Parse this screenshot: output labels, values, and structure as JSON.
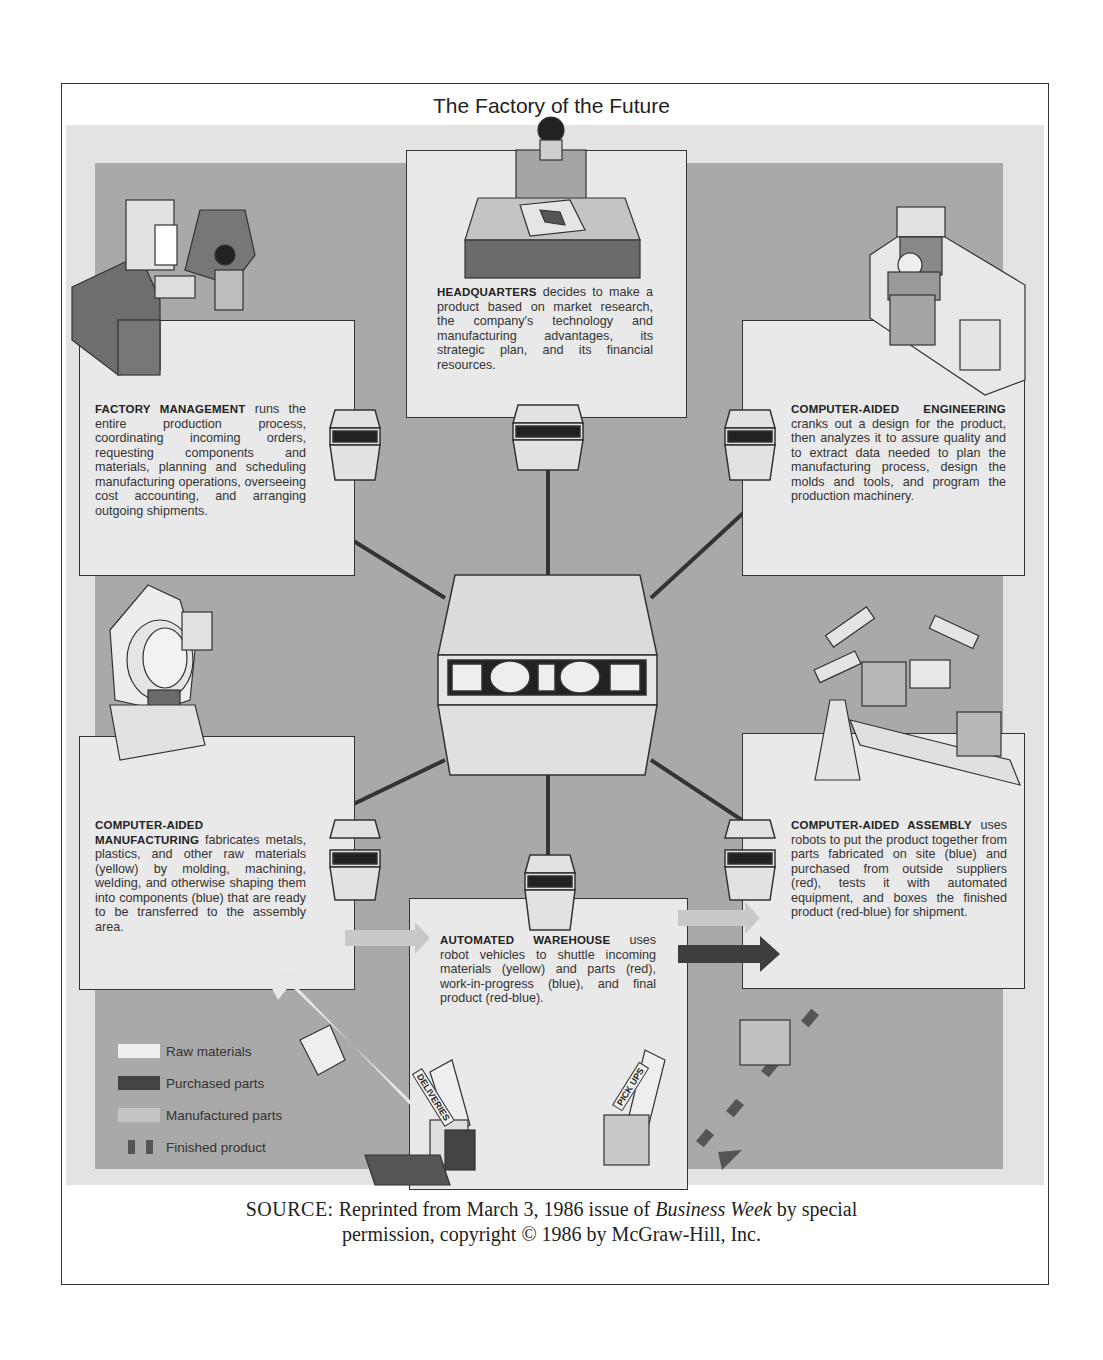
{
  "title": "The Factory of the Future",
  "nodes": {
    "headquarters": {
      "heading": "HEADQUARTERS",
      "body": "decides to make a product based on market research, the company's technology and manufacturing advantages, its strategic plan, and its financial resources."
    },
    "factory_management": {
      "heading": "FACTORY MANAGEMENT",
      "body": "runs the entire production process, coordinating incoming orders, requesting components and materials, planning and scheduling manufacturing operations, overseeing cost accounting, and arranging outgoing shipments."
    },
    "computer_aided_engineering": {
      "heading": "COMPUTER-AIDED ENGINEERING",
      "body": "cranks out a design for the product, then analyzes it to assure quality and to extract data needed to plan the manufacturing process, design the molds and tools, and program the production machinery."
    },
    "computer_aided_manufacturing": {
      "heading": "COMPUTER-AIDED MANUFACTURING",
      "body": "fabricates metals, plastics, and other raw materials (yellow) by molding, machining, welding, and otherwise shaping them into components (blue) that are ready to be transferred to the assembly area."
    },
    "computer_aided_assembly": {
      "heading": "COMPUTER-AIDED ASSEMBLY",
      "body": "uses robots to put the product together from parts fabricated on site (blue) and purchased from outside suppliers (red), tests it with automated equipment, and boxes the finished product (red-blue) for shipment."
    },
    "automated_warehouse": {
      "heading": "AUTOMATED WAREHOUSE",
      "body": "uses robot vehicles to shuttle incoming materials (yellow) and parts (red), work-in-progress (blue), and final product (red-blue)."
    }
  },
  "signs": {
    "deliveries": "DELIVERIES",
    "pickups": "PICK UPS"
  },
  "legend": [
    {
      "label": "Raw materials",
      "color": "#efefef"
    },
    {
      "label": "Purchased parts",
      "color": "#444444"
    },
    {
      "label": "Manufactured parts",
      "color": "#c4c4c4"
    },
    {
      "label": "Finished product",
      "color": "#555555"
    }
  ],
  "source": {
    "prefix": "SOURCE:",
    "line1_a": "Reprinted from March 3, 1986 issue of ",
    "publication": "Business Week",
    "line1_b": " by special",
    "line2": "permission, copyright © 1986 by McGraw-Hill, Inc."
  }
}
